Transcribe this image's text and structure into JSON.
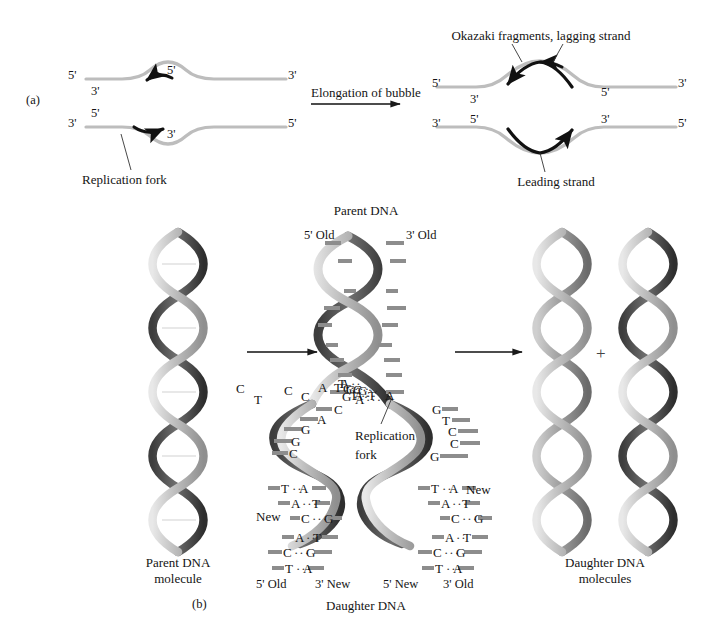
{
  "figure": {
    "background": "#ffffff",
    "ink": "#141414",
    "strand_gray": "#b9b9b9",
    "arrow_black": "#111111"
  },
  "panel_a": {
    "label": "(a)",
    "transition_label": "Elongation of bubble",
    "left_bubble": {
      "left_top_prime": "5'",
      "left_bottom_prime": "3'",
      "right_top_prime": "3'",
      "right_bottom_prime": "5'",
      "inner_top_left_prime": "3'",
      "inner_top_right_prime": "5'",
      "inner_bottom_left_prime": "5'",
      "inner_bottom_right_prime": "3'"
    },
    "right_bubble": {
      "left_top_prime": "5'",
      "left_bottom_prime": "3'",
      "right_top_prime": "3'",
      "right_bottom_prime": "5'",
      "inner_top_left_prime": "3'",
      "inner_top_right_prime": "5'",
      "inner_bottom_left_prime": "5'",
      "inner_bottom_right_prime": "3'"
    },
    "callouts": {
      "replication_fork": "Replication fork",
      "okazaki": "Okazaki fragments, lagging strand",
      "leading": "Leading strand"
    }
  },
  "panel_b": {
    "label": "(b)",
    "parent_molecule_label_line1": "Parent DNA",
    "parent_molecule_label_line2": "molecule",
    "parent_dna_title": "Parent DNA",
    "parent_left_end": "5' Old",
    "parent_right_end": "3' Old",
    "replication_fork_line1": "Replication",
    "replication_fork_line2": "fork",
    "new_label_left": "New",
    "new_label_right": "New",
    "daughter_dna_title": "Daughter DNA",
    "daughter_ends": [
      "5' Old",
      "3' New",
      "5' New",
      "3' Old"
    ],
    "daughter_molecules_line1": "Daughter DNA",
    "daughter_molecules_line2": "molecules",
    "plus_sign": "+",
    "parent_base_pairs": [
      {
        "left": "G",
        "right": "C"
      },
      {
        "left": "A",
        "right": "T"
      },
      {
        "left": "G",
        "right": "C"
      },
      {
        "left": "G",
        "right": "C"
      },
      {
        "left": "T",
        "right": "A"
      },
      {
        "left": "A",
        "right": "T"
      },
      {
        "left": "G",
        "right": "C"
      },
      {
        "left": "A",
        "right": "T"
      },
      {
        "left": "T",
        "right": "A"
      }
    ],
    "fork_unpaired_left": [
      "C",
      "A",
      "G",
      "G",
      "C"
    ],
    "fork_unpaired_right": [
      "G",
      "T",
      "C",
      "C",
      "G"
    ],
    "daughter_left_base_pairs": [
      {
        "left": "T",
        "right": "A"
      },
      {
        "left": "A",
        "right": "T"
      },
      {
        "left": "C",
        "right": "G"
      },
      {
        "left": "A",
        "right": "T"
      },
      {
        "left": "C",
        "right": "G"
      },
      {
        "left": "T",
        "right": "A"
      }
    ],
    "daughter_right_base_pairs": [
      {
        "left": "T",
        "right": "A"
      },
      {
        "left": "A",
        "right": "T"
      },
      {
        "left": "C",
        "right": "G"
      },
      {
        "left": "A",
        "right": "T"
      },
      {
        "left": "C",
        "right": "G"
      },
      {
        "left": "T",
        "right": "A"
      }
    ]
  }
}
